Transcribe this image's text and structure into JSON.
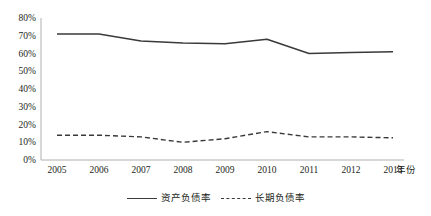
{
  "chart_data": {
    "type": "line",
    "title": "",
    "xlabel": "年份",
    "ylabel": "",
    "categories": [
      "2005",
      "2006",
      "2007",
      "2008",
      "2009",
      "2010",
      "2011",
      "2012",
      "2013"
    ],
    "ylim": [
      0,
      80
    ],
    "y_ticks": [
      "0%",
      "10%",
      "20%",
      "30%",
      "40%",
      "50%",
      "60%",
      "70%",
      "80%"
    ],
    "y_tick_values": [
      0,
      10,
      20,
      30,
      40,
      50,
      60,
      70,
      80
    ],
    "grid": false,
    "legend_position": "bottom",
    "series": [
      {
        "name": "资产负债率",
        "style": "solid",
        "color": "#3a3a3a",
        "values": [
          71,
          71,
          67,
          66,
          65.5,
          68,
          60,
          60.5,
          61
        ]
      },
      {
        "name": "长期负债率",
        "style": "dashed",
        "color": "#3a3a3a",
        "values": [
          14,
          14,
          13,
          10,
          12,
          16,
          13,
          13,
          12.5
        ]
      }
    ]
  },
  "axes": {
    "y_title": "",
    "x_title": "年份"
  }
}
